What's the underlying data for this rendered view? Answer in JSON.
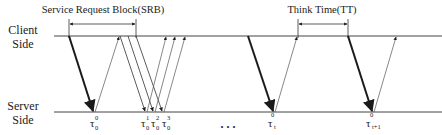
{
  "diagram": {
    "client_label": [
      "Client",
      "Side"
    ],
    "server_label": [
      "Server",
      "Side"
    ],
    "srb_label": "Service Request Block(SRB)",
    "tt_label": "Think Time(TT)",
    "ellipsis": ". . .",
    "timelines": {
      "client_y": 36,
      "server_y": 112,
      "x_start": 54,
      "x_end": 442
    },
    "brackets": [
      {
        "name": "srb",
        "x1": 69,
        "x2": 136,
        "y": 24
      },
      {
        "name": "tt",
        "x1": 298,
        "x2": 348,
        "y": 24
      }
    ],
    "requests": [
      {
        "from_x": 69,
        "to_x": 93,
        "bold": true
      },
      {
        "from_x": 120,
        "to_x": 145,
        "bold": false
      },
      {
        "from_x": 128,
        "to_x": 153,
        "bold": false
      },
      {
        "from_x": 136,
        "to_x": 162,
        "bold": false
      },
      {
        "from_x": 248,
        "to_x": 273,
        "bold": true
      },
      {
        "from_x": 348,
        "to_x": 372,
        "bold": true
      }
    ],
    "responses": [
      {
        "from_x": 96,
        "to_x": 119
      },
      {
        "from_x": 148,
        "to_x": 166
      },
      {
        "from_x": 156,
        "to_x": 175
      },
      {
        "from_x": 165,
        "to_x": 185
      },
      {
        "from_x": 276,
        "to_x": 297
      },
      {
        "from_x": 375,
        "to_x": 396
      }
    ],
    "tau_labels": [
      {
        "base": "τ",
        "sub": "0",
        "sup": "0",
        "x": 93
      },
      {
        "base": "τ",
        "sub": "0",
        "sup": "1",
        "x": 145
      },
      {
        "base": "τ",
        "sub": "0",
        "sup": "2",
        "x": 155
      },
      {
        "base": "τ",
        "sub": "0",
        "sup": "3",
        "x": 166
      },
      {
        "base": "τ",
        "sub": "t",
        "sup": "0",
        "x": 273
      },
      {
        "base": "τ",
        "sub": "t+1",
        "sup": "0",
        "x": 372
      }
    ]
  }
}
